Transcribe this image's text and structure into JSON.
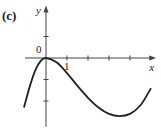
{
  "panel_label": "(c)",
  "chart_data": {
    "type": "line",
    "title": "",
    "xlabel": "x",
    "ylabel": "y",
    "origin_label": "0",
    "x_tick_labels": [
      {
        "value": 1,
        "text": "1"
      }
    ],
    "xlim": [
      -1,
      5.2
    ],
    "ylim": [
      -3.2,
      2.4
    ],
    "x_ticks": [
      1,
      2,
      3,
      4
    ],
    "y_ticks": [
      -2,
      -1,
      1
    ],
    "grid": false,
    "series": [
      {
        "name": "curve",
        "x": [
          -1.05,
          -0.75,
          -0.5,
          -0.25,
          0,
          0.5,
          1,
          1.5,
          2,
          2.5,
          3,
          3.5,
          4,
          4.5,
          5.0
        ],
        "y": [
          -2.3,
          -1.25,
          -0.55,
          -0.13,
          0,
          -0.2,
          -0.7,
          -1.3,
          -1.85,
          -2.3,
          -2.6,
          -2.7,
          -2.6,
          -2.2,
          -1.4
        ]
      }
    ]
  }
}
